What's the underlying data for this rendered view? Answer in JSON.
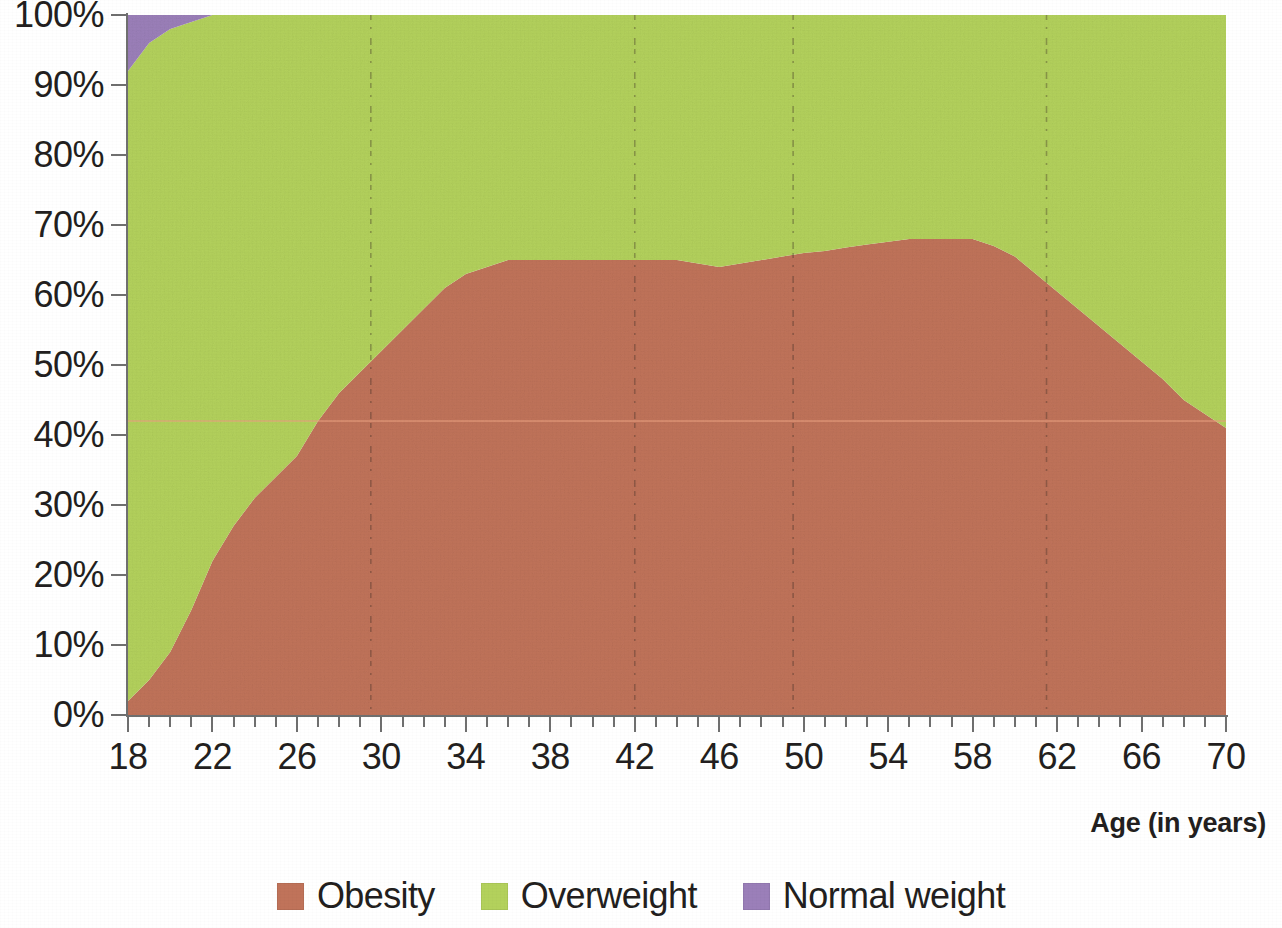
{
  "axes": {
    "x_title": "Age (in years)",
    "x_tick_labels": [
      "18",
      "22",
      "26",
      "30",
      "34",
      "38",
      "42",
      "46",
      "50",
      "54",
      "58",
      "62",
      "66",
      "70"
    ],
    "y_tick_labels": [
      "100%",
      "90%",
      "80%",
      "70%",
      "60%",
      "50%",
      "40%",
      "30%",
      "20%",
      "10%",
      "0%"
    ]
  },
  "legend": {
    "items": [
      {
        "label": "Obesity",
        "color": "#c0735a",
        "icon": "legend-swatch-icon"
      },
      {
        "label": "Overweight",
        "color": "#b3d15c",
        "icon": "legend-swatch-icon"
      },
      {
        "label": "Normal weight",
        "color": "#9b7fb9",
        "icon": "legend-swatch-icon"
      }
    ]
  },
  "colors": {
    "obesity": "#c0735a",
    "overweight": "#b3d15c",
    "normal_weight": "#9b7fb9",
    "axis": "#6f6f6f",
    "text": "#231f20",
    "background": "#ffffff",
    "scan_line": "#e8a07f"
  },
  "chart_data": {
    "type": "area",
    "subtype": "stacked-area-100-percent",
    "title": "",
    "subtitle": "",
    "xlabel": "Age (in years)",
    "ylabel": "",
    "xlim": [
      18,
      70
    ],
    "ylim": [
      0,
      100
    ],
    "xtick_step": 4,
    "xtick_minor_step": 1,
    "ytick_step": 10,
    "grid": false,
    "legend_position": "bottom-center",
    "stack_order_bottom_to_top": [
      "Obesity",
      "Overweight",
      "Normal weight"
    ],
    "x": [
      18,
      19,
      20,
      21,
      22,
      23,
      24,
      25,
      26,
      27,
      28,
      29,
      30,
      31,
      32,
      33,
      34,
      35,
      36,
      37,
      38,
      39,
      40,
      41,
      42,
      43,
      44,
      45,
      46,
      47,
      48,
      49,
      50,
      51,
      52,
      53,
      54,
      55,
      56,
      57,
      58,
      59,
      60,
      61,
      62,
      63,
      64,
      65,
      66,
      67,
      68,
      69,
      70
    ],
    "series": [
      {
        "name": "Obesity",
        "color": "#c0735a",
        "values": [
          2,
          5,
          9,
          15,
          22,
          27,
          31,
          34,
          37,
          42,
          46,
          49,
          52,
          55,
          58,
          61,
          63,
          64,
          65,
          65,
          65,
          65,
          65,
          65,
          65,
          65,
          65,
          64.5,
          64,
          64.5,
          65,
          65.5,
          66,
          66.3,
          66.8,
          67.2,
          67.6,
          68,
          68,
          68,
          68,
          67,
          65.5,
          63,
          60.5,
          58,
          55.5,
          53,
          50.5,
          48,
          45,
          43,
          41
        ]
      },
      {
        "name": "Overweight",
        "color": "#b3d15c",
        "values": [
          90,
          91,
          89,
          84,
          78,
          73,
          69,
          66,
          63,
          58,
          54,
          51,
          48,
          45,
          42,
          39,
          37,
          36,
          35,
          35,
          35,
          35,
          35,
          35,
          35,
          35,
          35,
          35.5,
          36,
          35.5,
          35,
          34.5,
          34,
          33.7,
          33.2,
          32.8,
          32.4,
          32,
          32,
          32,
          32,
          33,
          34.5,
          37,
          39.5,
          42,
          44.5,
          47,
          49.5,
          52,
          55,
          57,
          59
        ]
      },
      {
        "name": "Normal weight",
        "color": "#9b7fb9",
        "values": [
          8,
          4,
          2,
          1,
          0,
          0,
          0,
          0,
          0,
          0,
          0,
          0,
          0,
          0,
          0,
          0,
          0,
          0,
          0,
          0,
          0,
          0,
          0,
          0,
          0,
          0,
          0,
          0,
          0,
          0,
          0,
          0,
          0,
          0,
          0,
          0,
          0,
          0,
          0,
          0,
          0,
          0,
          0,
          0,
          0,
          0,
          0,
          0,
          0,
          0,
          0,
          0,
          0
        ]
      }
    ],
    "annotations": [
      {
        "kind": "scan-artifact-line",
        "orientation": "horizontal",
        "y_value": 42,
        "color": "#e8a07f"
      },
      {
        "kind": "scan-artifact-line",
        "orientation": "vertical",
        "x_value": 29.5
      },
      {
        "kind": "scan-artifact-line",
        "orientation": "vertical",
        "x_value": 42
      },
      {
        "kind": "scan-artifact-line",
        "orientation": "vertical",
        "x_value": 49.5
      },
      {
        "kind": "scan-artifact-line",
        "orientation": "vertical",
        "x_value": 61.5
      }
    ]
  }
}
